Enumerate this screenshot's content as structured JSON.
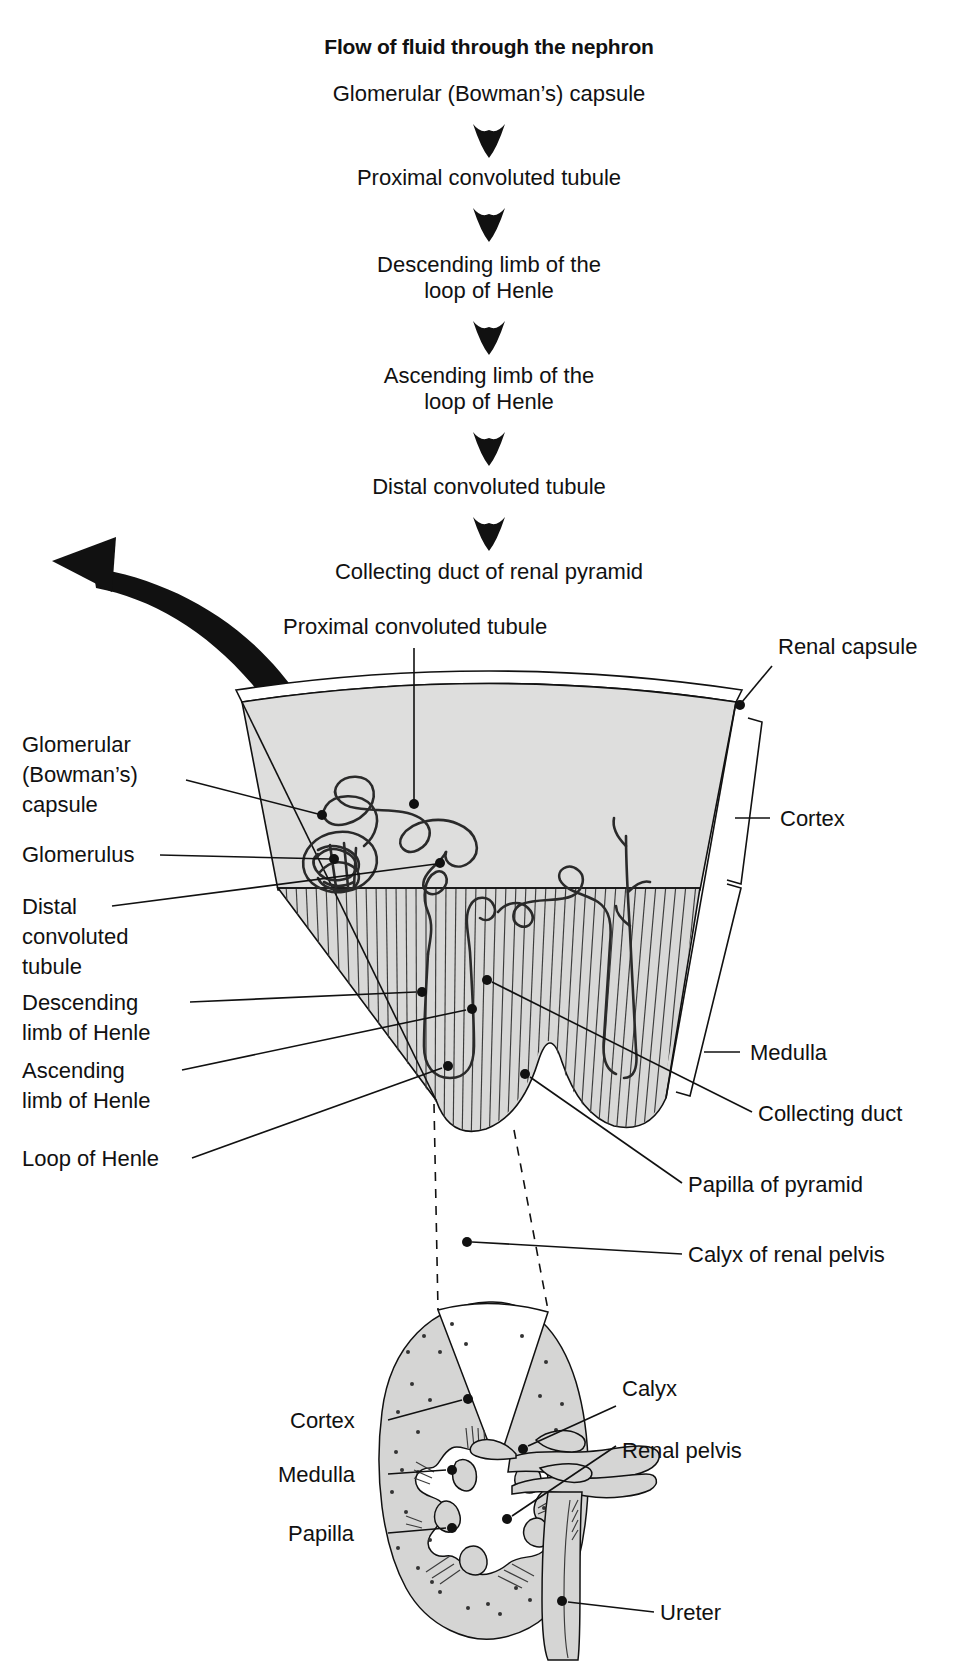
{
  "title": "Flow of fluid through the nephron",
  "flow_steps": [
    {
      "id": "step-1",
      "lines": [
        "Glomerular (Bowman’s) capsule"
      ]
    },
    {
      "id": "step-2",
      "lines": [
        "Proximal convoluted tubule"
      ]
    },
    {
      "id": "step-3",
      "lines": [
        "Descending limb of the",
        "loop of Henle"
      ]
    },
    {
      "id": "step-4",
      "lines": [
        "Ascending limb of the",
        "loop of Henle"
      ]
    },
    {
      "id": "step-5",
      "lines": [
        "Distal convoluted tubule"
      ]
    },
    {
      "id": "step-6",
      "lines": [
        "Collecting duct of renal pyramid"
      ]
    }
  ],
  "wedge_labels": {
    "top": "Proximal convoluted tubule",
    "left": [
      {
        "id": "glomerular-capsule",
        "lines": [
          "Glomerular",
          "(Bowman’s)",
          "capsule"
        ]
      },
      {
        "id": "glomerulus",
        "lines": [
          "Glomerulus"
        ]
      },
      {
        "id": "distal-convoluted-tubule",
        "lines": [
          "Distal",
          "convoluted",
          "tubule"
        ]
      },
      {
        "id": "descending-limb",
        "lines": [
          "Descending",
          "limb of Henle"
        ]
      },
      {
        "id": "ascending-limb",
        "lines": [
          "Ascending",
          "limb of Henle"
        ]
      },
      {
        "id": "loop-of-henle",
        "lines": [
          "Loop of Henle"
        ]
      }
    ],
    "right": [
      {
        "id": "renal-capsule",
        "lines": [
          "Renal capsule"
        ]
      },
      {
        "id": "cortex",
        "lines": [
          "Cortex"
        ]
      },
      {
        "id": "medulla",
        "lines": [
          "Medulla"
        ]
      },
      {
        "id": "collecting-duct",
        "lines": [
          "Collecting duct"
        ]
      },
      {
        "id": "papilla-of-pyramid",
        "lines": [
          "Papilla of pyramid"
        ]
      },
      {
        "id": "calyx-of-renal-pelvis",
        "lines": [
          "Calyx of renal pelvis"
        ]
      }
    ]
  },
  "inset_labels": {
    "left": [
      {
        "id": "inset-cortex",
        "lines": [
          "Cortex"
        ]
      },
      {
        "id": "inset-medulla",
        "lines": [
          "Medulla"
        ]
      },
      {
        "id": "inset-papilla",
        "lines": [
          "Papilla"
        ]
      }
    ],
    "right": [
      {
        "id": "inset-calyx",
        "lines": [
          "Calyx"
        ]
      },
      {
        "id": "inset-renal-pelvis",
        "lines": [
          "Renal pelvis"
        ]
      },
      {
        "id": "inset-ureter",
        "lines": [
          "Ureter"
        ]
      }
    ]
  },
  "colors": {
    "ink": "#111111",
    "cortex_fill": "#dededd",
    "medulla_fill": "#d8d8d7",
    "inset_fill": "#d5d5d4",
    "background": "#ffffff"
  }
}
